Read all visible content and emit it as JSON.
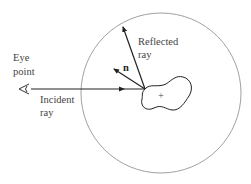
{
  "diagram": {
    "labels": {
      "eye_point_line1": "Eye",
      "eye_point_line2": "point",
      "incident_line1": "Incident",
      "incident_line2": "ray",
      "reflected_line1": "Reflected",
      "reflected_line2": "ray",
      "normal": "n",
      "object_center": "+"
    },
    "colors": {
      "stroke": "#222222",
      "circle": "#777777",
      "text": "#444444",
      "background": "#ffffff"
    }
  }
}
